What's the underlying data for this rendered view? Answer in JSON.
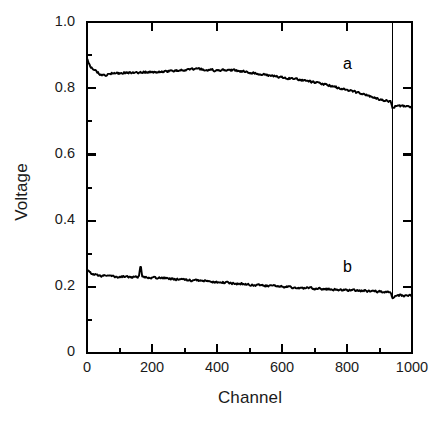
{
  "chart_data": {
    "type": "line",
    "title": "",
    "subtitle": "",
    "xlabel": "Channel",
    "ylabel": "Voltage",
    "xlim": [
      0,
      1000
    ],
    "ylim": [
      0,
      1.0
    ],
    "grid": false,
    "legend_position": "inline-annotation",
    "xticks": [
      0,
      200,
      400,
      600,
      800,
      1000
    ],
    "xtick_labels": [
      "0",
      "200",
      "400",
      "600",
      "800",
      "1000"
    ],
    "x_minor_tick_interval": 100,
    "yticks": [
      0,
      0.2,
      0.4,
      0.6,
      0.8,
      1.0
    ],
    "ytick_labels": [
      "0",
      "0.2",
      "0.4",
      "0.6",
      "0.8",
      "1.0"
    ],
    "y_minor_tick_interval": 0.1,
    "annotations": [
      {
        "text": "a",
        "x": 795,
        "y": 0.875
      },
      {
        "text": "b",
        "x": 795,
        "y": 0.255
      }
    ],
    "line_color": "#000000",
    "marker_vertical_line_x": 940,
    "series": [
      {
        "name": "a",
        "label": "a",
        "x": [
          0,
          10,
          20,
          30,
          40,
          50,
          60,
          70,
          80,
          90,
          100,
          120,
          140,
          160,
          180,
          200,
          220,
          240,
          260,
          280,
          300,
          320,
          340,
          360,
          380,
          400,
          420,
          440,
          460,
          480,
          500,
          520,
          540,
          560,
          580,
          600,
          620,
          640,
          660,
          680,
          700,
          720,
          740,
          760,
          780,
          800,
          820,
          840,
          860,
          880,
          900,
          920,
          935,
          940,
          950,
          960,
          970,
          980,
          990,
          1000
        ],
        "values": [
          0.888,
          0.866,
          0.858,
          0.85,
          0.843,
          0.838,
          0.84,
          0.845,
          0.846,
          0.844,
          0.845,
          0.848,
          0.846,
          0.848,
          0.849,
          0.848,
          0.85,
          0.851,
          0.852,
          0.853,
          0.855,
          0.857,
          0.858,
          0.856,
          0.855,
          0.853,
          0.854,
          0.855,
          0.853,
          0.85,
          0.848,
          0.845,
          0.842,
          0.839,
          0.836,
          0.833,
          0.83,
          0.828,
          0.825,
          0.821,
          0.818,
          0.814,
          0.81,
          0.805,
          0.8,
          0.795,
          0.79,
          0.784,
          0.779,
          0.772,
          0.766,
          0.762,
          0.759,
          0.742,
          0.746,
          0.747,
          0.746,
          0.745,
          0.745,
          0.744
        ]
      },
      {
        "name": "b",
        "label": "b",
        "x": [
          0,
          10,
          20,
          30,
          40,
          50,
          60,
          80,
          100,
          120,
          140,
          160,
          165,
          170,
          180,
          200,
          220,
          240,
          260,
          280,
          300,
          320,
          340,
          360,
          380,
          400,
          420,
          440,
          460,
          480,
          500,
          520,
          540,
          560,
          580,
          600,
          620,
          640,
          660,
          680,
          700,
          720,
          740,
          760,
          780,
          800,
          820,
          840,
          860,
          880,
          900,
          920,
          935,
          940,
          950,
          960,
          970,
          980,
          990,
          1000
        ],
        "values": [
          0.252,
          0.243,
          0.238,
          0.235,
          0.234,
          0.233,
          0.232,
          0.231,
          0.23,
          0.23,
          0.23,
          0.23,
          0.265,
          0.231,
          0.229,
          0.228,
          0.227,
          0.226,
          0.224,
          0.222,
          0.221,
          0.22,
          0.219,
          0.218,
          0.216,
          0.214,
          0.213,
          0.211,
          0.21,
          0.208,
          0.207,
          0.205,
          0.204,
          0.203,
          0.202,
          0.2,
          0.199,
          0.198,
          0.197,
          0.196,
          0.195,
          0.194,
          0.193,
          0.192,
          0.191,
          0.19,
          0.189,
          0.188,
          0.187,
          0.186,
          0.185,
          0.184,
          0.183,
          0.163,
          0.173,
          0.174,
          0.174,
          0.173,
          0.173,
          0.172
        ]
      }
    ]
  },
  "axes": {
    "ylabel": "Voltage",
    "xlabel": "Channel"
  },
  "labels": {
    "series_a": "a",
    "series_b": "b"
  },
  "ticks": {
    "y": [
      "1.0",
      "0.8",
      "0.6",
      "0.4",
      "0.2",
      "0"
    ],
    "x": [
      "0",
      "200",
      "400",
      "600",
      "800",
      "1000"
    ]
  }
}
